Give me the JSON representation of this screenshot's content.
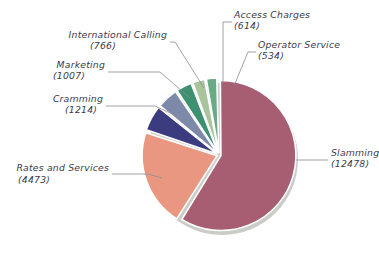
{
  "chart_data": {
    "type": "pie",
    "title": "",
    "subtitle": "",
    "xlabel": "",
    "ylabel": "",
    "legend_position": "none",
    "grid": false,
    "total": 21086,
    "categories": [
      "Slamming",
      "Rates and Services",
      "Cramming",
      "Marketing",
      "International Calling",
      "Access Charges",
      "Operator Service"
    ],
    "values": [
      12478,
      4473,
      1214,
      1007,
      766,
      614,
      534
    ],
    "colors": [
      "#a85e72",
      "#ea9781",
      "#3b3b80",
      "#7d89a9",
      "#3d9070",
      "#a9c49c",
      "#6aab86"
    ],
    "slices": [
      {
        "name": "slamming",
        "label": "Slamming",
        "value_label": "(12478)",
        "value": 12478,
        "color": "#a85e72"
      },
      {
        "name": "rates-and-services",
        "label": "Rates and Services",
        "value_label": "(4473)",
        "value": 4473,
        "color": "#ea9781"
      },
      {
        "name": "cramming",
        "label": "Cramming",
        "value_label": "(1214)",
        "value": 1214,
        "color": "#3b3b80"
      },
      {
        "name": "marketing",
        "label": "Marketing",
        "value_label": "(1007)",
        "value": 1007,
        "color": "#7d89a9"
      },
      {
        "name": "international-calling",
        "label": "International Calling",
        "value_label": "(766)",
        "value": 766,
        "color": "#3d9070"
      },
      {
        "name": "access-charges",
        "label": "Access Charges",
        "value_label": "(614)",
        "value": 614,
        "color": "#a9c49c"
      },
      {
        "name": "operator-service",
        "label": "Operator Service",
        "value_label": "(534)",
        "value": 534,
        "color": "#6aab86"
      }
    ]
  },
  "style": {
    "background": "#ffffff",
    "slice_border": "#ffffff",
    "leader_line": "#8a8a96",
    "text_color": "#3a3a4a",
    "shadow": "#b9b9b4"
  }
}
